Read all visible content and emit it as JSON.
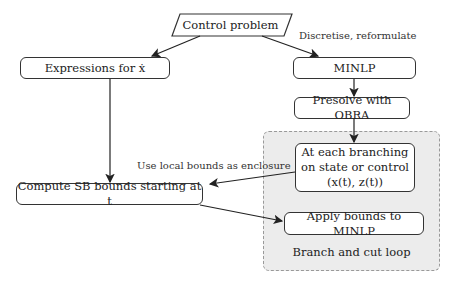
{
  "diagram": {
    "nodes": {
      "control_problem": "Control problem",
      "expressions": "Expressions for ẋ",
      "minlp": "MINLP",
      "presolve": "Presolve with OBRA",
      "branching_line1": "At each branching",
      "branching_line2": "on state or control",
      "branching_line3": "(x(t), z(t))",
      "compute_sb": "Compute SB bounds starting at t",
      "apply_bounds": "Apply bounds to MINLP"
    },
    "edge_labels": {
      "discretise": "Discretise, reformulate",
      "use_local": "Use local bounds as enclosure"
    },
    "region_label": "Branch and cut loop",
    "colors": {
      "region_fill": "#ececec",
      "region_border": "#999999",
      "stroke": "#333333"
    }
  }
}
